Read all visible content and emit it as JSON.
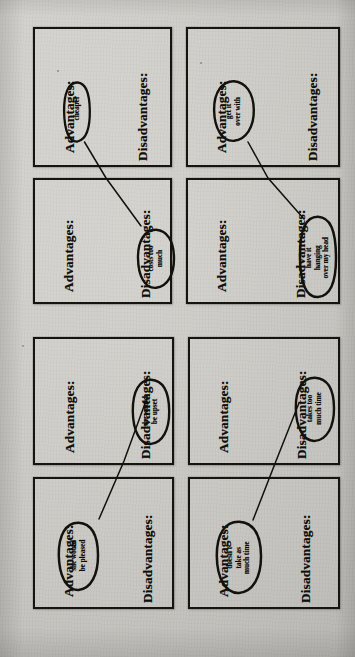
{
  "document": {
    "type": "scanned-worksheet",
    "orientation": "rotated-90-clockwise",
    "paper_color": "#c9c7c2",
    "ink_color": "#15140f",
    "panel_count": 8
  },
  "labels": {
    "advantages": "Advantages:",
    "disadvantages": "Disadvantages:"
  },
  "panels": [
    {
      "id": "panel-1",
      "row": 1,
      "col": 1,
      "advantages_label": "Advantages:",
      "disadvantages_label": "Disadvantages:",
      "annotation": {
        "text": "cheaper",
        "lines": [
          "cheaper"
        ],
        "side": "advantages"
      }
    },
    {
      "id": "panel-2",
      "row": 1,
      "col": 2,
      "advantages_label": "Advantages:",
      "disadvantages_label": "Disadvantages:",
      "annotation": {
        "text": "get it over with",
        "lines": [
          "get it",
          "over with"
        ],
        "side": "advantages"
      }
    },
    {
      "id": "panel-3",
      "row": 2,
      "col": 1,
      "advantages_label": "Advantages:",
      "disadvantages_label": "Disadvantages:",
      "annotation": {
        "text": "costs too much",
        "lines": [
          "costs too",
          "much"
        ],
        "side": "disadvantages"
      }
    },
    {
      "id": "panel-4",
      "row": 2,
      "col": 2,
      "advantages_label": "Advantages:",
      "disadvantages_label": "Disadvantages:",
      "annotation": {
        "text": "have it hanging over my head",
        "lines": [
          "have it",
          "hanging",
          "over my head"
        ],
        "side": "disadvantages"
      }
    },
    {
      "id": "panel-5",
      "row": 3,
      "col": 1,
      "advantages_label": "Advantages:",
      "disadvantages_label": "Disadvantages:",
      "annotation": {
        "text": "she would be upset",
        "lines": [
          "she would",
          "be upset"
        ],
        "side": "disadvantages"
      }
    },
    {
      "id": "panel-6",
      "row": 3,
      "col": 2,
      "advantages_label": "Advantages:",
      "disadvantages_label": "Disadvantages:",
      "annotation": {
        "text": "takes too much time",
        "lines": [
          "takes too",
          "much time"
        ],
        "side": "disadvantages"
      }
    },
    {
      "id": "panel-7",
      "row": 4,
      "col": 1,
      "advantages_label": "Advantages:",
      "disadvantages_label": "Disadvantages:",
      "annotation": {
        "text": "she would be pleased",
        "lines": [
          "she would",
          "be pleased"
        ],
        "side": "advantages"
      }
    },
    {
      "id": "panel-8",
      "row": 4,
      "col": 2,
      "advantages_label": "Advantages:",
      "disadvantages_label": "Disadvantages:",
      "annotation": {
        "text": "doesn't take as much time",
        "lines": [
          "doesn't",
          "take as",
          "much time"
        ],
        "side": "advantages"
      }
    }
  ],
  "connectors": [
    {
      "id": "connector-cheaper-costs",
      "from": "cheaper",
      "to": "costs too much"
    },
    {
      "id": "connector-getit-hanging",
      "from": "get it over with",
      "to": "have it hanging over my head"
    },
    {
      "id": "connector-upset-pleased",
      "from": "she would be upset",
      "to": "she would be pleased"
    },
    {
      "id": "connector-takestime-doesnt",
      "from": "takes too much time",
      "to": "doesn't take as much time"
    }
  ]
}
